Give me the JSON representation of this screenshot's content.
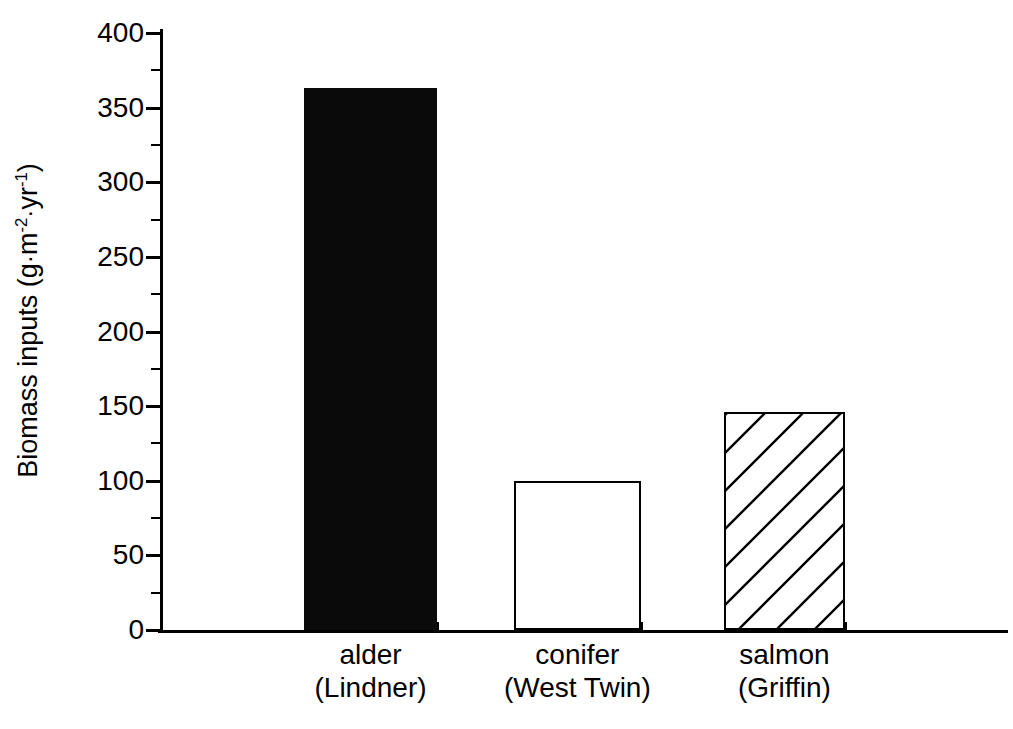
{
  "chart_data": {
    "type": "bar",
    "title": "",
    "subtitle": "",
    "xlabel": "",
    "ylabel": "Biomass inputs (g·m⁻²·yr⁻¹)",
    "ylabel_parts": {
      "prefix": "Biomass inputs (g",
      "dot1": "·",
      "m": "m",
      "m_exp": "-2",
      "dot2": "·",
      "yr": "yr",
      "yr_exp": "-1",
      "suffix": ")"
    },
    "categories": [
      "alder\n(Lindner)",
      "conifer\n(West Twin)",
      "salmon\n(Griffin)"
    ],
    "category_labels": [
      {
        "line1": "alder",
        "line2": "(Lindner)"
      },
      {
        "line1": "conifer",
        "line2": "(West Twin)"
      },
      {
        "line1": "salmon",
        "line2": "(Griffin)"
      }
    ],
    "values": [
      363,
      100,
      146
    ],
    "ylim": [
      0,
      400
    ],
    "yticks": [
      0,
      50,
      100,
      150,
      200,
      250,
      300,
      350,
      400
    ],
    "ytick_labels": [
      "0",
      "50",
      "100",
      "150",
      "200",
      "250",
      "300",
      "350",
      "400"
    ],
    "yminor_ticks": [
      25,
      75,
      125,
      175,
      225,
      275,
      325,
      375
    ],
    "grid": false,
    "legend": "none",
    "bar_styles": [
      "solid-black",
      "open-white",
      "diagonal-hatch"
    ],
    "colors": {
      "bar_fill_solid": "#0a0a0a",
      "bar_fill_open": "#ffffff",
      "bar_edge": "#000000",
      "axis": "#000000",
      "background": "#ffffff",
      "text": "#000000"
    }
  }
}
